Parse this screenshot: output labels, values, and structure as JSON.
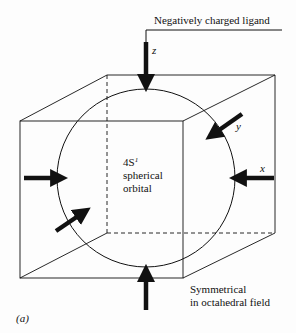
{
  "figure": {
    "panel_label": "(a)",
    "ligand_label": "Negatively charged ligand",
    "orbital": {
      "name": "4S",
      "superscript": "1",
      "line2": "spherical",
      "line3": "orbital"
    },
    "symmetry_note": {
      "line1": "Symmetrical",
      "line2": "in octahedral field"
    },
    "axes": {
      "x": "x",
      "y": "y",
      "z": "z"
    },
    "arrows": [
      {
        "name": "z-top",
        "direction": "down"
      },
      {
        "name": "z-bottom",
        "direction": "up"
      },
      {
        "name": "x-right",
        "direction": "left"
      },
      {
        "name": "x-left",
        "direction": "right"
      },
      {
        "name": "y-back",
        "direction": "down-left"
      },
      {
        "name": "y-front",
        "direction": "up-right"
      }
    ],
    "colors": {
      "ink": "#111111",
      "background": "#fdfdfd"
    }
  }
}
